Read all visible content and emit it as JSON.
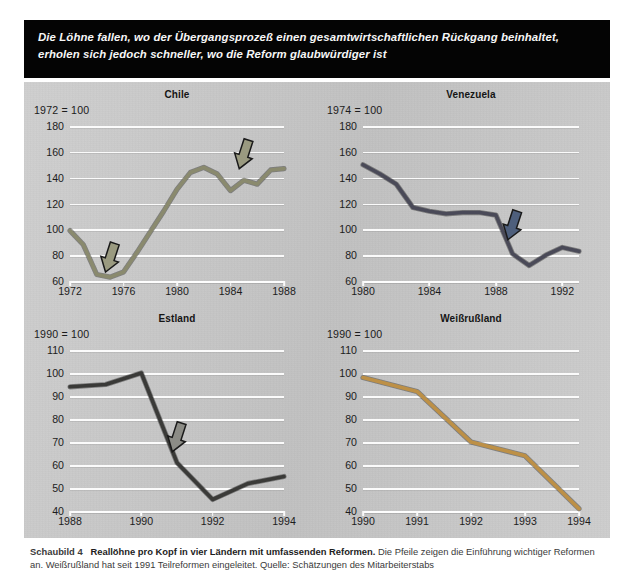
{
  "banner": {
    "line1": "Die Löhne fallen, wo der Übergangsprozeß einen gesamtwirtschaftlichen Rückgang beinhaltet,",
    "line2": "erholen sich jedoch schneller, wo die Reform glaubwürdiger ist"
  },
  "caption": {
    "figure_label": "Schaubild 4",
    "bold_title": "Reallöhne pro Kopf in vier Ländern mit umfassenden Reformen.",
    "rest": " Die Pfeile zeigen die Einführung wichtiger Reformen an. Weißrußland hat seit 1991 Teilreformen eingeleitet. Quelle: Schätzungen des Mitarbeiterstabs"
  },
  "colors": {
    "panel_background": "#c9c9c9",
    "banner_background": "#040404",
    "gridline": "#fbfbfb",
    "chile_line": "#8a8a6e",
    "venezuela_line": "#4a4a58",
    "estland_line": "#3a3a38",
    "belarus_line": "#bd9046",
    "arrow_chile": "#9a9a80",
    "arrow_venezuela": "#4e5f7c",
    "arrow_estland": "#8c8c86",
    "arrow_outline": "#1a1a1a"
  },
  "chart_data": [
    {
      "type": "line",
      "title": "Chile",
      "base_note": "1972 = 100",
      "xlabel": "",
      "ylabel": "",
      "ylim": [
        60,
        180
      ],
      "yticks": [
        60,
        80,
        100,
        120,
        140,
        160,
        180
      ],
      "xlim": [
        1972,
        1988
      ],
      "xticks": [
        1972,
        1976,
        1980,
        1984,
        1988
      ],
      "grid": true,
      "legend": "none",
      "line_color": "#8a8a6e",
      "x": [
        1972,
        1973,
        1974,
        1975,
        1976,
        1977,
        1978,
        1979,
        1980,
        1981,
        1982,
        1983,
        1984,
        1985,
        1986,
        1987,
        1988
      ],
      "values": [
        99,
        88,
        65,
        63,
        67,
        82,
        98,
        114,
        131,
        144,
        148,
        143,
        130,
        138,
        135,
        146,
        147
      ],
      "annotations": [
        {
          "name": "arrow-1975",
          "x": 1975,
          "y": 78,
          "note": "Einführung wichtiger Reformen"
        },
        {
          "name": "arrow-1985",
          "x": 1985,
          "y": 158,
          "note": "Einführung wichtiger Reformen"
        }
      ]
    },
    {
      "type": "line",
      "title": "Venezuela",
      "base_note": "1974 = 100",
      "xlabel": "",
      "ylabel": "",
      "ylim": [
        60,
        180
      ],
      "yticks": [
        60,
        80,
        100,
        120,
        140,
        160,
        180
      ],
      "xlim": [
        1980,
        1993
      ],
      "xticks": [
        1980,
        1984,
        1988,
        1992
      ],
      "grid": true,
      "legend": "none",
      "line_color": "#4a4a58",
      "x": [
        1980,
        1981,
        1982,
        1983,
        1984,
        1985,
        1986,
        1987,
        1988,
        1989,
        1990,
        1991,
        1992,
        1993
      ],
      "values": [
        150,
        143,
        135,
        117,
        114,
        112,
        113,
        113,
        111,
        81,
        72,
        80,
        86,
        83
      ],
      "annotations": [
        {
          "name": "arrow-1989",
          "x": 1989,
          "y": 103,
          "note": "Einführung wichtiger Reformen"
        }
      ]
    },
    {
      "type": "line",
      "title": "Estland",
      "base_note": "1990 = 100",
      "xlabel": "",
      "ylabel": "",
      "ylim": [
        40,
        110
      ],
      "yticks": [
        40,
        50,
        60,
        70,
        80,
        90,
        100,
        110
      ],
      "xlim": [
        1988,
        1994
      ],
      "xticks": [
        1988,
        1990,
        1992,
        1994
      ],
      "grid": true,
      "legend": "none",
      "line_color": "#3a3a38",
      "x": [
        1988,
        1989,
        1990,
        1991,
        1992,
        1993,
        1994
      ],
      "values": [
        94,
        95,
        100,
        61,
        45,
        52,
        55
      ],
      "annotations": [
        {
          "name": "arrow-1991",
          "x": 1991,
          "y": 72,
          "note": "Einführung wichtiger Reformen"
        }
      ]
    },
    {
      "type": "line",
      "title": "Weißrußland",
      "base_note": "1990 = 100",
      "xlabel": "",
      "ylabel": "",
      "ylim": [
        40,
        110
      ],
      "yticks": [
        40,
        50,
        60,
        70,
        80,
        90,
        100,
        110
      ],
      "xlim": [
        1990,
        1994
      ],
      "xticks": [
        1990,
        1991,
        1992,
        1993,
        1994
      ],
      "grid": true,
      "legend": "none",
      "line_color": "#bd9046",
      "x": [
        1990,
        1991,
        1992,
        1993,
        1994
      ],
      "values": [
        98,
        92,
        70,
        64,
        41
      ],
      "annotations": []
    }
  ]
}
